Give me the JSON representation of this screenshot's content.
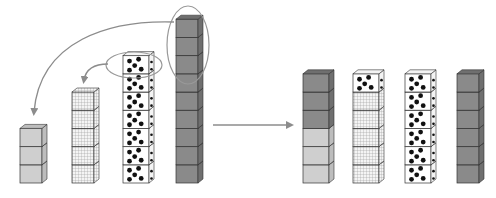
{
  "diagram": {
    "colors": {
      "light": "#cfcfcf",
      "dark": "#8a8a8a",
      "grid_bg": "#f2f2f2",
      "dots_bg": "#ffffff",
      "stroke": "#333333",
      "arrow": "#8c8c8c"
    },
    "before": {
      "towers": [
        {
          "pattern": "light",
          "count": 3
        },
        {
          "pattern": "grid",
          "count": 5
        },
        {
          "pattern": "dots",
          "count": 7
        },
        {
          "pattern": "dark",
          "count": 9
        }
      ],
      "moves": [
        {
          "from_tower": 4,
          "to_tower": 1,
          "cubes": 3
        },
        {
          "from_tower": 3,
          "to_tower": 2,
          "cubes": 1
        }
      ]
    },
    "after": {
      "towers": [
        {
          "segments": [
            {
              "pattern": "light",
              "count": 3
            },
            {
              "pattern": "dark",
              "count": 3
            }
          ],
          "total": 6
        },
        {
          "segments": [
            {
              "pattern": "grid",
              "count": 5
            },
            {
              "pattern": "dots",
              "count": 1
            }
          ],
          "total": 6
        },
        {
          "segments": [
            {
              "pattern": "dots",
              "count": 6
            }
          ],
          "total": 6
        },
        {
          "segments": [
            {
              "pattern": "dark",
              "count": 6
            }
          ],
          "total": 6
        }
      ]
    }
  }
}
